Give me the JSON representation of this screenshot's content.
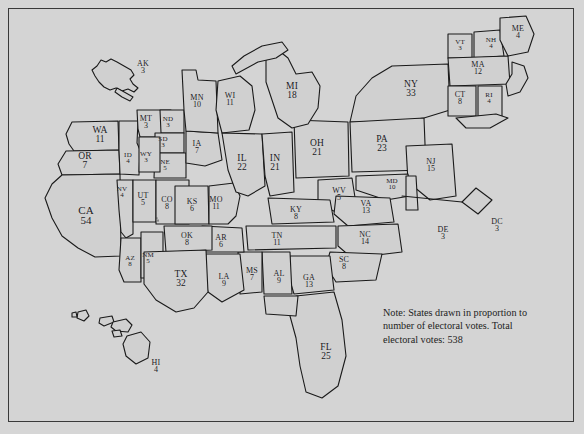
{
  "figure": {
    "background_color": "#d4d4d4",
    "border_color": "#3a3a3a",
    "ink_color": "#18181c"
  },
  "note": {
    "line1": "Note: States drawn in proportion to",
    "line2": "number of electoral votes.  Total",
    "line3": "electoral votes: 538"
  },
  "map_data": {
    "type": "cartogram",
    "unit": "electoral votes",
    "total": 538,
    "states": [
      {
        "abbr": "AK",
        "votes": 3,
        "x": 143,
        "y": 67,
        "size": "sm"
      },
      {
        "abbr": "WA",
        "votes": 11,
        "x": 100,
        "y": 135,
        "size": "md"
      },
      {
        "abbr": "OR",
        "votes": 7,
        "x": 85,
        "y": 161,
        "size": "md"
      },
      {
        "abbr": "CA",
        "votes": 54,
        "x": 86,
        "y": 215,
        "size": "lg"
      },
      {
        "abbr": "MT",
        "votes": 3,
        "x": 146,
        "y": 122,
        "size": "sm"
      },
      {
        "abbr": "ND",
        "votes": 3,
        "x": 168,
        "y": 122,
        "size": "xs"
      },
      {
        "abbr": "SD",
        "votes": 3,
        "x": 163,
        "y": 142,
        "size": "xs"
      },
      {
        "abbr": "NE",
        "votes": 5,
        "x": 165,
        "y": 165,
        "size": "xs"
      },
      {
        "abbr": "ID",
        "votes": 4,
        "x": 128,
        "y": 158,
        "size": "xs"
      },
      {
        "abbr": "WY",
        "votes": 3,
        "x": 146,
        "y": 157,
        "size": "xs"
      },
      {
        "abbr": "NV",
        "votes": 4,
        "x": 122,
        "y": 192,
        "size": "xs"
      },
      {
        "abbr": "UT",
        "votes": 5,
        "x": 143,
        "y": 199,
        "size": "sm"
      },
      {
        "abbr": "CO",
        "votes": 8,
        "x": 167,
        "y": 203,
        "size": "sm"
      },
      {
        "abbr": "KS",
        "votes": 6,
        "x": 192,
        "y": 205,
        "size": "sm"
      },
      {
        "abbr": "MO",
        "votes": 11,
        "x": 216,
        "y": 203,
        "size": "sm"
      },
      {
        "abbr": "IA",
        "votes": 7,
        "x": 197,
        "y": 147,
        "size": "sm"
      },
      {
        "abbr": "MN",
        "votes": 10,
        "x": 197,
        "y": 101,
        "size": "sm"
      },
      {
        "abbr": "WI",
        "votes": 11,
        "x": 230,
        "y": 99,
        "size": "sm"
      },
      {
        "abbr": "MI",
        "votes": 18,
        "x": 292,
        "y": 91,
        "size": "md"
      },
      {
        "abbr": "IL",
        "votes": 22,
        "x": 242,
        "y": 163,
        "size": "md"
      },
      {
        "abbr": "IN",
        "votes": 21,
        "x": 275,
        "y": 163,
        "size": "md"
      },
      {
        "abbr": "OH",
        "votes": 21,
        "x": 317,
        "y": 148,
        "size": "md"
      },
      {
        "abbr": "PA",
        "votes": 23,
        "x": 382,
        "y": 144,
        "size": "md"
      },
      {
        "abbr": "NY",
        "votes": 33,
        "x": 411,
        "y": 89,
        "size": "md"
      },
      {
        "abbr": "VT",
        "votes": 3,
        "x": 460,
        "y": 45,
        "size": "xs"
      },
      {
        "abbr": "NH",
        "votes": 4,
        "x": 491,
        "y": 43,
        "size": "xs"
      },
      {
        "abbr": "ME",
        "votes": 4,
        "x": 518,
        "y": 32,
        "size": "sm"
      },
      {
        "abbr": "MA",
        "votes": 12,
        "x": 478,
        "y": 68,
        "size": "sm"
      },
      {
        "abbr": "CT",
        "votes": 8,
        "x": 460,
        "y": 98,
        "size": "sm"
      },
      {
        "abbr": "RI",
        "votes": 4,
        "x": 489,
        "y": 98,
        "size": "xs"
      },
      {
        "abbr": "NJ",
        "votes": 15,
        "x": 431,
        "y": 165,
        "size": "sm"
      },
      {
        "abbr": "MD",
        "votes": 10,
        "x": 392,
        "y": 184,
        "size": "xs"
      },
      {
        "abbr": "DE",
        "votes": 3,
        "x": 443,
        "y": 233,
        "size": "sm"
      },
      {
        "abbr": "DC",
        "votes": 3,
        "x": 497,
        "y": 225,
        "size": "sm"
      },
      {
        "abbr": "WV",
        "votes": 5,
        "x": 339,
        "y": 194,
        "size": "sm"
      },
      {
        "abbr": "VA",
        "votes": 13,
        "x": 366,
        "y": 207,
        "size": "sm"
      },
      {
        "abbr": "KY",
        "votes": 8,
        "x": 296,
        "y": 213,
        "size": "sm"
      },
      {
        "abbr": "NC",
        "votes": 14,
        "x": 365,
        "y": 238,
        "size": "sm"
      },
      {
        "abbr": "SC",
        "votes": 8,
        "x": 344,
        "y": 263,
        "size": "sm"
      },
      {
        "abbr": "TN",
        "votes": 11,
        "x": 277,
        "y": 239,
        "size": "sm"
      },
      {
        "abbr": "GA",
        "votes": 13,
        "x": 309,
        "y": 281,
        "size": "sm"
      },
      {
        "abbr": "AL",
        "votes": 9,
        "x": 279,
        "y": 277,
        "size": "sm"
      },
      {
        "abbr": "MS",
        "votes": 7,
        "x": 252,
        "y": 274,
        "size": "sm"
      },
      {
        "abbr": "AR",
        "votes": 6,
        "x": 221,
        "y": 241,
        "size": "sm"
      },
      {
        "abbr": "LA",
        "votes": 9,
        "x": 224,
        "y": 280,
        "size": "sm"
      },
      {
        "abbr": "OK",
        "votes": 8,
        "x": 187,
        "y": 239,
        "size": "sm"
      },
      {
        "abbr": "TX",
        "votes": 32,
        "x": 181,
        "y": 279,
        "size": "md"
      },
      {
        "abbr": "NM",
        "votes": 5,
        "x": 148,
        "y": 258,
        "size": "xs"
      },
      {
        "abbr": "AZ",
        "votes": 8,
        "x": 130,
        "y": 261,
        "size": "xs"
      },
      {
        "abbr": "FL",
        "votes": 25,
        "x": 326,
        "y": 352,
        "size": "md"
      },
      {
        "abbr": "HI",
        "votes": 4,
        "x": 156,
        "y": 366,
        "size": "sm"
      }
    ]
  }
}
